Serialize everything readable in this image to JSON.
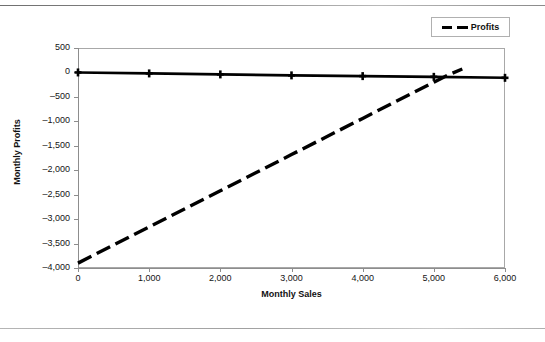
{
  "chart_data": {
    "type": "line",
    "title": "",
    "xlabel": "Monthly Sales",
    "ylabel": "Monthly Profits",
    "xlim": [
      0,
      6000
    ],
    "ylim": [
      -4000,
      500
    ],
    "xticks": [
      0,
      1000,
      2000,
      3000,
      4000,
      5000,
      6000
    ],
    "xtick_labels": [
      "0",
      "1,000",
      "2,000",
      "3,000",
      "4,000",
      "5,000",
      "6,000"
    ],
    "yticks": [
      500,
      0,
      -500,
      -1000,
      -1500,
      -2000,
      -2500,
      -3000,
      -3500,
      -4000
    ],
    "ytick_labels": [
      "500",
      "0",
      "–500",
      "–1,000",
      "–1,500",
      "–2,000",
      "–2,500",
      "–3,000",
      "–3,500",
      "–4,000"
    ],
    "grid": false,
    "legend_position": "top-right",
    "series": [
      {
        "name": "Baseline",
        "style": "solid",
        "marker": "plus",
        "color": "#000000",
        "in_legend": false,
        "x": [
          0,
          1000,
          2000,
          3000,
          4000,
          5000,
          6000
        ],
        "values": [
          0,
          -20,
          -40,
          -60,
          -75,
          -90,
          -110
        ]
      },
      {
        "name": "Profits",
        "style": "dashed",
        "marker": "none",
        "color": "#000000",
        "in_legend": true,
        "x": [
          0,
          1000,
          2000,
          3000,
          4000,
          5000,
          5200,
          5400
        ],
        "values": [
          -3900,
          -3160,
          -2420,
          -1680,
          -940,
          -200,
          -52,
          70
        ]
      }
    ],
    "annotations": [
      {
        "text": "break-even crossing",
        "x": 5200,
        "y": 0,
        "visible": false
      }
    ]
  },
  "legend": {
    "entries": [
      {
        "label": "Profits",
        "swatch": "dashed-line-swatch"
      }
    ]
  },
  "page": {
    "rule_top": "horizontal-rule",
    "rule_bottom": "horizontal-rule"
  }
}
